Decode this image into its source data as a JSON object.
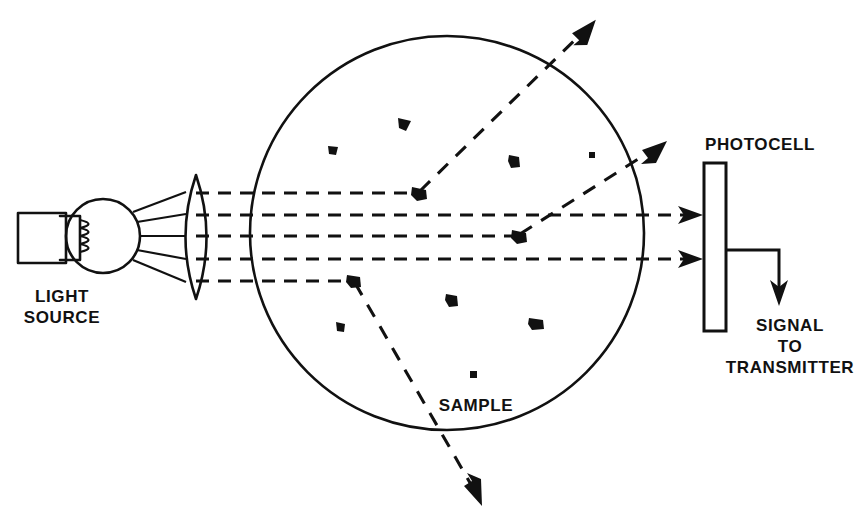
{
  "figure": {
    "type": "optical-scattering-schematic",
    "background_color": "#ffffff",
    "ink_color": "#111111",
    "width": 859,
    "height": 529
  },
  "labels": {
    "light_source_line1": "LIGHT",
    "light_source_line2": "SOURCE",
    "sample": "SAMPLE",
    "photocell": "PHOTOCELL",
    "signal_line1": "SIGNAL",
    "signal_line2": "TO",
    "signal_line3": "TRANSMITTER"
  },
  "components": {
    "lamp": {
      "name": "light-source-lamp",
      "base_rect": {
        "x": 18,
        "y": 213,
        "width": 48,
        "height": 50
      },
      "bulb_circle": {
        "cx": 103,
        "cy": 236,
        "r": 37
      },
      "filament_turns": 3
    },
    "lens": {
      "name": "collimating-lens",
      "cx": 196,
      "cy": 237,
      "rx": 21,
      "ry": 62
    },
    "sample_cell": {
      "name": "sample-chamber",
      "cx": 447,
      "cy": 233,
      "r": 197
    },
    "photocell": {
      "name": "photocell-detector",
      "x": 704,
      "y": 163,
      "width": 22,
      "height": 168,
      "fill_pattern": "cross-hatch-diamond"
    },
    "signal_path": {
      "name": "signal-output-wire",
      "start_x": 726,
      "start_y": 250,
      "corner_x": 779,
      "end_y": 303
    }
  },
  "rays": {
    "diverging_from_lamp": [
      {
        "x1": 133,
        "y1": 212,
        "x2": 184,
        "y2": 193
      },
      {
        "x1": 137,
        "y1": 222,
        "x2": 184,
        "y2": 215
      },
      {
        "x1": 140,
        "y1": 236,
        "x2": 184,
        "y2": 236
      },
      {
        "x1": 137,
        "y1": 250,
        "x2": 184,
        "y2": 259
      },
      {
        "x1": 133,
        "y1": 260,
        "x2": 184,
        "y2": 281
      }
    ],
    "collimated_beams": [
      {
        "id": "beam-1",
        "y": 193,
        "from_x": 196,
        "to_x": 418,
        "scatters": true
      },
      {
        "id": "beam-2",
        "y": 215,
        "from_x": 196,
        "to_x": 700,
        "scatters": false
      },
      {
        "id": "beam-3",
        "y": 236,
        "from_x": 196,
        "to_x": 518,
        "scatters": true
      },
      {
        "id": "beam-4",
        "y": 259,
        "from_x": 196,
        "to_x": 700,
        "scatters": false
      },
      {
        "id": "beam-5",
        "y": 281,
        "from_x": 196,
        "to_x": 353,
        "scatters": true
      }
    ],
    "scattered": [
      {
        "id": "scatter-up-left",
        "x1": 418,
        "y1": 193,
        "x2": 594,
        "y2": 22
      },
      {
        "id": "scatter-up-right",
        "x1": 518,
        "y1": 236,
        "x2": 663,
        "y2": 143
      },
      {
        "id": "scatter-down",
        "x1": 353,
        "y1": 281,
        "x2": 481,
        "y2": 505
      }
    ],
    "detector_arrows": [
      {
        "id": "detector-arrow-upper",
        "y": 215,
        "tip_x": 702
      },
      {
        "id": "detector-arrow-lower",
        "y": 259,
        "tip_x": 702
      }
    ]
  },
  "particles": [
    {
      "x": 403,
      "y": 123,
      "w": 10,
      "h": 9,
      "rot": 18
    },
    {
      "x": 332,
      "y": 150,
      "w": 7,
      "h": 7,
      "rot": 40
    },
    {
      "x": 513,
      "y": 161,
      "w": 9,
      "h": 11,
      "rot": 10
    },
    {
      "x": 592,
      "y": 155,
      "w": 5,
      "h": 5,
      "rot": 0
    },
    {
      "x": 418,
      "y": 193,
      "w": 11,
      "h": 10,
      "rot": 25
    },
    {
      "x": 518,
      "y": 236,
      "w": 11,
      "h": 10,
      "rot": 25
    },
    {
      "x": 353,
      "y": 281,
      "w": 10,
      "h": 9,
      "rot": 30
    },
    {
      "x": 451,
      "y": 300,
      "w": 9,
      "h": 10,
      "rot": 15
    },
    {
      "x": 535,
      "y": 323,
      "w": 10,
      "h": 8,
      "rot": 30
    },
    {
      "x": 340,
      "y": 327,
      "w": 7,
      "h": 8,
      "rot": 35
    },
    {
      "x": 473,
      "y": 374,
      "w": 5,
      "h": 5,
      "rot": 0
    }
  ],
  "text_positions": {
    "light_source": {
      "x": 62,
      "y1": 302,
      "y2": 323
    },
    "sample": {
      "x": 476,
      "y": 411
    },
    "photocell": {
      "x": 760,
      "y": 150
    },
    "signal": {
      "x": 790,
      "y1": 331,
      "y2": 352,
      "y3": 373
    }
  }
}
